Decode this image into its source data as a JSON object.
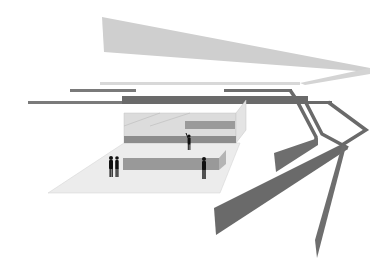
{
  "diagram": {
    "type": "exploded-axonometric-architecture",
    "background": "#ffffff",
    "colors": {
      "roof_plane": "#cfcfcf",
      "roof_edge": "#d6d6d6",
      "structure_dark": "#6a6a6a",
      "structure_mid": "#7a7a7a",
      "floor_plane": "#ececec",
      "glass_volume": "#d9d9d9",
      "counter": "#8c8c8c",
      "figure": "#111111"
    },
    "elements": [
      {
        "id": "roof-canopy",
        "label": "Tapered roof canopy"
      },
      {
        "id": "roof-edge-beam",
        "label": "Roof edge beam"
      },
      {
        "id": "upper-beams",
        "label": "Upper beams"
      },
      {
        "id": "main-beam",
        "label": "Main horizontal beam"
      },
      {
        "id": "bent-frames",
        "label": "Folded structural frames"
      },
      {
        "id": "diagonal-ramps",
        "label": "Diagonal ramps / supports"
      },
      {
        "id": "upper-volume",
        "label": "Raised interior volume"
      },
      {
        "id": "floor-plate",
        "label": "Ground floor plate"
      },
      {
        "id": "counters",
        "label": "Counters / benches"
      },
      {
        "id": "people",
        "label": "Human scale figures",
        "count": 4
      }
    ]
  }
}
